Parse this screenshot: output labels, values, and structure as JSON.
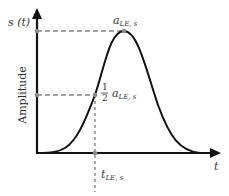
{
  "diagram": {
    "y_axis_label": "s (t)",
    "y_axis_title": "Amplitude",
    "x_axis_label": "t",
    "peak_label_main": "a",
    "peak_label_sub": "LE, s",
    "half_label_num": "1",
    "half_label_den": "2",
    "half_label_main": "a",
    "half_label_sub": "LE, s",
    "time_label_main": "t",
    "time_label_sub": "LE, s"
  },
  "colors": {
    "curve": "#111111",
    "axis": "#111111",
    "dash": "#888888",
    "marker": "#888888"
  }
}
